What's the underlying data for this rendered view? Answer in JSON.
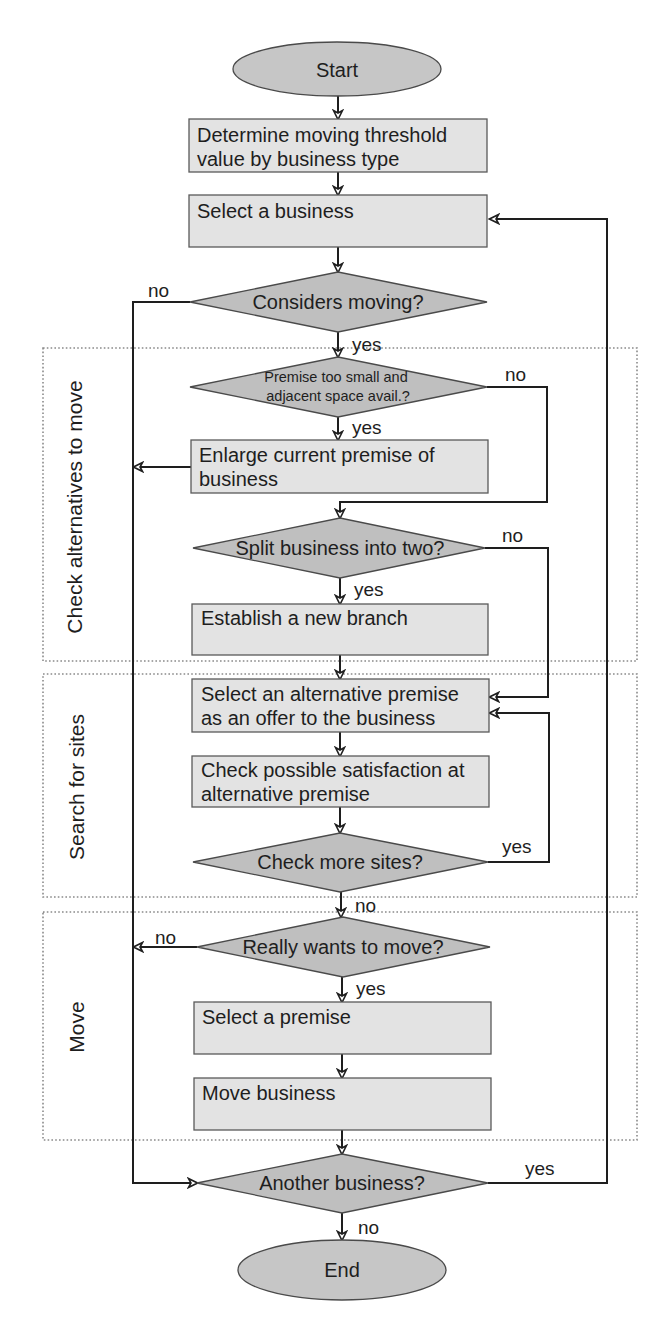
{
  "diagram": {
    "colors": {
      "process_fill": "#e3e3e3",
      "decision_fill": "#bfbfbf",
      "terminal_fill": "#c6c6c6",
      "line": "#1e1e1e",
      "section_border": "#8a8a8a"
    },
    "terminals": {
      "start": "Start",
      "end": "End"
    },
    "sections": [
      {
        "label": "Check alternatives to move"
      },
      {
        "label": "Search for sites"
      },
      {
        "label": "Move"
      }
    ],
    "nodes": {
      "determine_threshold": [
        "Determine moving threshold",
        "value by business type"
      ],
      "select_business": "Select a business",
      "considers_moving": "Considers moving?",
      "premise_too_small": [
        "Premise too small and",
        "adjacent space avail.?"
      ],
      "enlarge_premise": [
        "Enlarge current premise of",
        "business"
      ],
      "split_business": "Split business into two?",
      "establish_branch": "Establish a new branch",
      "select_alternative": [
        "Select an alternative premise",
        "as an offer to the business"
      ],
      "check_satisfaction": [
        "Check possible satisfaction at",
        "alternative premise"
      ],
      "check_more_sites": "Check more sites?",
      "really_wants_move": "Really wants to move?",
      "select_premise": "Select a premise",
      "move_business": "Move business",
      "another_business": "Another business?"
    },
    "edge_labels": {
      "considers_moving_no": "no",
      "considers_moving_yes": "yes",
      "premise_no": "no",
      "premise_yes": "yes",
      "split_no": "no",
      "split_yes": "yes",
      "check_more_yes": "yes",
      "check_more_no": "no",
      "really_move_no": "no",
      "really_move_yes": "yes",
      "another_yes": "yes",
      "another_no": "no"
    }
  }
}
